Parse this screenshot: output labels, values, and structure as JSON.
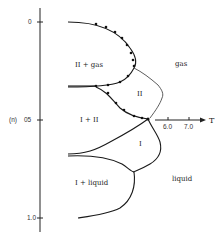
{
  "diagram": {
    "type": "phase-diagram",
    "y_axis": {
      "label": "⟨n⟩",
      "ticks": [
        "0",
        "0.5",
        "1.0"
      ],
      "tick_labels_display": [
        "0",
        "0.5",
        "1.0"
      ],
      "direction": "increasing-downward"
    },
    "x_axis": {
      "label": "T",
      "ticks": [
        "6.0",
        "7.0"
      ]
    },
    "regions": [
      {
        "id": "II-gas",
        "label": "II + gas"
      },
      {
        "id": "gas",
        "label": "gas"
      },
      {
        "id": "II",
        "label": "II"
      },
      {
        "id": "I-II",
        "label": "I + II"
      },
      {
        "id": "I",
        "label": "I"
      },
      {
        "id": "I-liquid",
        "label": "I + liquid"
      },
      {
        "id": "liquid",
        "label": "liquid"
      }
    ],
    "colors": {
      "ink": "#1a1a1a",
      "background": "#ffffff"
    }
  }
}
